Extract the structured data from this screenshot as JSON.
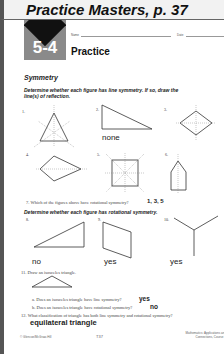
{
  "banner": {
    "title": "Practice Masters, p. 37"
  },
  "header": {
    "lesson_number": "5-4",
    "heading": "Practice",
    "name_label": "Name",
    "date_label": "Date"
  },
  "section": {
    "title": "Symmetry",
    "instruction_line": "Determine whether each figure has line symmetry. If so, draw the line(s) of reflection.",
    "instruction_rot": "Determine whether each figure has rotational symmetry."
  },
  "figures": {
    "f1": {
      "label": "1."
    },
    "f2": {
      "label": "2.",
      "answer": "none"
    },
    "f3": {
      "label": "3."
    },
    "f4": {
      "label": "4."
    },
    "f5": {
      "label": "5."
    },
    "f6": {
      "label": "6."
    },
    "f8": {
      "label": "8.",
      "answer": "no"
    },
    "f9": {
      "label": "9.",
      "answer": "yes"
    },
    "f10": {
      "label": "10.",
      "answer": "yes"
    }
  },
  "questions": {
    "q7": {
      "text": "7. Which of the figures above have rotational symmetry?",
      "answer": "1, 3, 5"
    },
    "q11": {
      "text": "11. Draw an isosceles triangle."
    },
    "q11a": {
      "text": "a. Does an isosceles triangle have line symmetry?",
      "answer": "yes"
    },
    "q11b": {
      "text": "b. Does an isosceles triangle have rotational symmetry?",
      "answer": "no"
    },
    "q12": {
      "text": "12. What classification of triangle has both line symmetry and rotational symmetry?",
      "answer": "equilateral triangle"
    }
  },
  "footer": {
    "copyright": "© Glencoe/McGraw-Hill",
    "page": "T37",
    "book": "Mathematics: Applications and Connections, Course 3"
  }
}
